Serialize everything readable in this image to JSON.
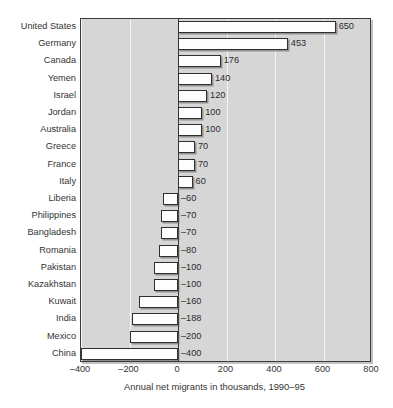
{
  "chart_data": {
    "type": "bar",
    "orientation": "horizontal",
    "title": "",
    "xlabel": "Annual net migrants in thousands, 1990–95",
    "ylabel": "",
    "xlim": [
      -400,
      800
    ],
    "xticks": [
      -400,
      -200,
      0,
      200,
      400,
      600,
      800
    ],
    "xtick_labels": [
      "–400",
      "–200",
      "0",
      "200",
      "400",
      "600",
      "800"
    ],
    "grid": true,
    "grid_axis": "x",
    "legend": "none",
    "categories": [
      "United States",
      "Germany",
      "Canada",
      "Yemen",
      "Israel",
      "Jordan",
      "Australia",
      "Greece",
      "France",
      "Italy",
      "Liberia",
      "Philippines",
      "Bangladesh",
      "Romania",
      "Pakistan",
      "Kazakhstan",
      "Kuwait",
      "India",
      "Mexico",
      "China"
    ],
    "values": [
      650,
      453,
      176,
      140,
      120,
      100,
      100,
      70,
      70,
      60,
      -60,
      -70,
      -70,
      -80,
      -100,
      -100,
      -160,
      -188,
      -200,
      -400
    ],
    "value_labels": [
      "650",
      "453",
      "176",
      "140",
      "120",
      "100",
      "100",
      "70",
      "70",
      "60",
      "–60",
      "–70",
      "–70",
      "–80",
      "–100",
      "–100",
      "–160",
      "–188",
      "–200",
      "–400"
    ],
    "colors": {
      "plot_background": "#d6d6d6",
      "bar_fill": "#fdfdfd",
      "bar_edge": "#303030",
      "gridline": "#f4f4f4",
      "zeroline": "#3a3a3a",
      "text": "#2b2b2b",
      "page_background": "#ffffff"
    }
  }
}
